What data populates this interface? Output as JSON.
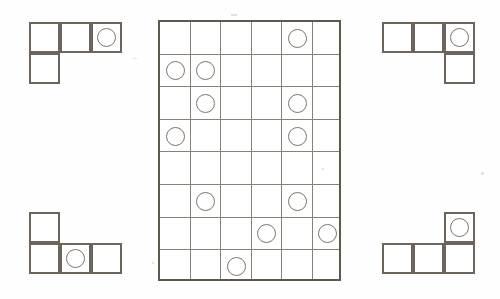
{
  "puzzle": {
    "title": "Tetromino placement puzzle",
    "background_color": "#fefefe",
    "grid_line_color": "#8a8175",
    "frame_color": "#5f584f",
    "piece_border_color": "#6d655c",
    "circle_color": "#7d746a"
  },
  "main_grid": {
    "name": "main-grid",
    "columns": 6,
    "rows": 8,
    "cell_width": 30.5,
    "cell_height": 32.6,
    "origin_x": 158,
    "origin_y": 20,
    "circles": [
      {
        "row": 1,
        "col": 5
      },
      {
        "row": 2,
        "col": 1
      },
      {
        "row": 2,
        "col": 2
      },
      {
        "row": 3,
        "col": 2
      },
      {
        "row": 3,
        "col": 5
      },
      {
        "row": 4,
        "col": 1
      },
      {
        "row": 4,
        "col": 5
      },
      {
        "row": 6,
        "col": 2
      },
      {
        "row": 6,
        "col": 5
      },
      {
        "row": 7,
        "col": 4
      },
      {
        "row": 7,
        "col": 6
      },
      {
        "row": 8,
        "col": 3
      }
    ],
    "circle_count": 12
  },
  "pieces": [
    {
      "name": "piece-top-left",
      "shape": "J-tetromino",
      "origin_x": 29,
      "origin_y": 22,
      "cell_width": 31,
      "cell_height": 31,
      "cells": [
        {
          "row": 1,
          "col": 1
        },
        {
          "row": 1,
          "col": 2
        },
        {
          "row": 1,
          "col": 3
        },
        {
          "row": 2,
          "col": 1
        }
      ],
      "circles": [
        {
          "row": 1,
          "col": 3
        }
      ]
    },
    {
      "name": "piece-top-right",
      "shape": "L-tetromino",
      "origin_x": 382,
      "origin_y": 22,
      "cell_width": 31,
      "cell_height": 31,
      "cells": [
        {
          "row": 1,
          "col": 1
        },
        {
          "row": 1,
          "col": 2
        },
        {
          "row": 1,
          "col": 3
        },
        {
          "row": 2,
          "col": 3
        }
      ],
      "circles": [
        {
          "row": 1,
          "col": 3
        }
      ]
    },
    {
      "name": "piece-bottom-left",
      "shape": "J-tetromino",
      "origin_x": 29,
      "origin_y": 212,
      "cell_width": 31,
      "cell_height": 31,
      "cells": [
        {
          "row": 1,
          "col": 1
        },
        {
          "row": 2,
          "col": 1
        },
        {
          "row": 2,
          "col": 2
        },
        {
          "row": 2,
          "col": 3
        }
      ],
      "circles": [
        {
          "row": 2,
          "col": 2
        }
      ]
    },
    {
      "name": "piece-bottom-right",
      "shape": "L-tetromino",
      "origin_x": 382,
      "origin_y": 212,
      "cell_width": 31,
      "cell_height": 31,
      "cells": [
        {
          "row": 1,
          "col": 3
        },
        {
          "row": 2,
          "col": 1
        },
        {
          "row": 2,
          "col": 2
        },
        {
          "row": 2,
          "col": 3
        }
      ],
      "circles": [
        {
          "row": 1,
          "col": 3
        }
      ]
    }
  ],
  "specks": [
    {
      "x": 133,
      "y": 58,
      "w": 4,
      "h": 1
    },
    {
      "x": 231,
      "y": 14,
      "w": 6,
      "h": 2
    },
    {
      "x": 322,
      "y": 168,
      "w": 2,
      "h": 2
    },
    {
      "x": 481,
      "y": 172,
      "w": 3,
      "h": 3
    },
    {
      "x": 152,
      "y": 262,
      "w": 2,
      "h": 2
    }
  ]
}
